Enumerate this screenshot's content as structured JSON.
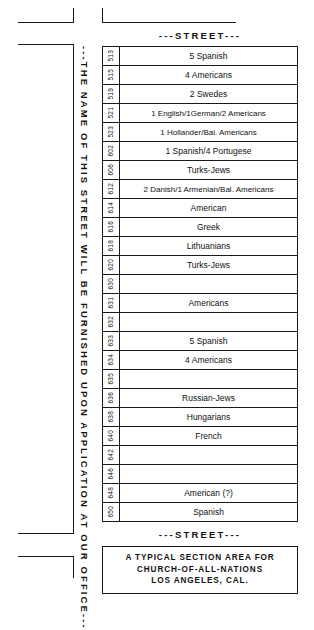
{
  "figure": {
    "vertical_street_note": "---THE NAME OF THIS STREET WILL BE FURNISHED UPON APPLICATION AT OUR OFFICE---",
    "street_header_top": "---STREET---",
    "street_header_bottom": "---STREET---",
    "caption": {
      "line1": "A TYPICAL SECTION AREA FOR",
      "line2": "CHURCH-OF-ALL-NATIONS",
      "line3": "LOS ANGELES, CAL."
    },
    "colors": {
      "ink": "#1a1a1a",
      "paper": "#ffffff"
    }
  },
  "lots": [
    {
      "number": "513",
      "occupants": "5 Spanish"
    },
    {
      "number": "515",
      "occupants": "4 Americans"
    },
    {
      "number": "519",
      "occupants": "2 Swedes"
    },
    {
      "number": "521",
      "occupants": "1 English/1German/2 Americans"
    },
    {
      "number": "523",
      "occupants": "1 Hollander/Bal. Americans"
    },
    {
      "number": "602",
      "occupants": "1 Spanish/4 Portugese"
    },
    {
      "number": "606",
      "occupants": "Turks-Jews"
    },
    {
      "number": "612",
      "occupants": "2 Danish/1 Armenian/Bal. Americans"
    },
    {
      "number": "614",
      "occupants": "American"
    },
    {
      "number": "616",
      "occupants": "Greek"
    },
    {
      "number": "618",
      "occupants": "Lithuanians"
    },
    {
      "number": "620",
      "occupants": "Turks-Jews"
    },
    {
      "number": "630",
      "occupants": ""
    },
    {
      "number": "631",
      "occupants": "Americans"
    },
    {
      "number": "632",
      "occupants": ""
    },
    {
      "number": "633",
      "occupants": "5 Spanish"
    },
    {
      "number": "634",
      "occupants": "4 Americans"
    },
    {
      "number": "635",
      "occupants": ""
    },
    {
      "number": "636",
      "occupants": "Russian-Jews"
    },
    {
      "number": "638",
      "occupants": "Hungarians"
    },
    {
      "number": "640",
      "occupants": "French"
    },
    {
      "number": "642",
      "occupants": ""
    },
    {
      "number": "646",
      "occupants": ""
    },
    {
      "number": "648",
      "occupants": "American (?)"
    },
    {
      "number": "650",
      "occupants": "Spanish"
    }
  ]
}
